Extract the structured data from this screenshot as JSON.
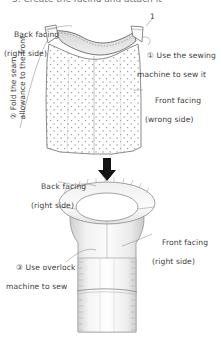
{
  "document": {
    "title_fragment": "3. Create the facing and attach it",
    "type": "sewing-instruction-diagram",
    "background_color": "#ffffff",
    "ink_color": "#3d3d3d",
    "fabric_fill": "#ffffff",
    "fabric_shade": "#e8e8e8",
    "accent_gray": "#d9d9d9"
  },
  "step1": {
    "label_back_facing": {
      "line1": "Back facing",
      "line2": "(right side)"
    },
    "label_front_facing": {
      "line1": "Front facing",
      "line2": "(wrong side)"
    },
    "callout_sew": {
      "number": "①",
      "line1": " Use the sewing",
      "line2": "machine to sew it"
    },
    "callout_fold": {
      "number": "②",
      "line1": " Fold the seam",
      "line2": "allowance to the front."
    },
    "seam_mark": "1"
  },
  "arrow": {
    "direction": "down",
    "icon": "down-arrow-icon"
  },
  "step2": {
    "label_back_facing": {
      "line1": "Back facing",
      "line2": "(right side)"
    },
    "label_front_facing": {
      "line1": "Front facing",
      "line2": "(right side)"
    },
    "callout_overlock": {
      "number": "③",
      "line1": " Use overlock",
      "line2": "machine to sew"
    }
  }
}
